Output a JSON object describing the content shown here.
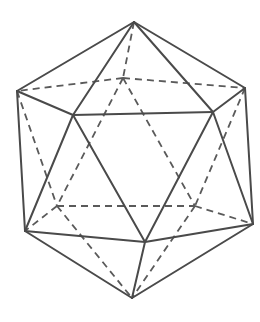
{
  "diagram": {
    "stroke_color": "#4a4a4a",
    "background": "#ffffff",
    "vertices": {
      "T": [
        134,
        22
      ],
      "L": [
        17,
        91
      ],
      "R": [
        245,
        88
      ],
      "BU": [
        123,
        78
      ],
      "FL": [
        73,
        115
      ],
      "FR": [
        213,
        112
      ],
      "LL": [
        25,
        231
      ],
      "LR": [
        253,
        224
      ],
      "BF": [
        145,
        242
      ],
      "HLL": [
        57,
        206
      ],
      "HLR": [
        195,
        206
      ],
      "B": [
        132,
        298
      ]
    },
    "solid_edges": [
      [
        "T",
        "L"
      ],
      [
        "T",
        "FL"
      ],
      [
        "T",
        "FR"
      ],
      [
        "T",
        "R"
      ],
      [
        "L",
        "FL"
      ],
      [
        "FL",
        "FR"
      ],
      [
        "FR",
        "R"
      ],
      [
        "L",
        "LL"
      ],
      [
        "FL",
        "LL"
      ],
      [
        "FL",
        "BF"
      ],
      [
        "FR",
        "BF"
      ],
      [
        "FR",
        "LR"
      ],
      [
        "R",
        "LR"
      ],
      [
        "LL",
        "BF"
      ],
      [
        "BF",
        "LR"
      ],
      [
        "LL",
        "B"
      ],
      [
        "BF",
        "B"
      ],
      [
        "LR",
        "B"
      ]
    ],
    "dashed_edges": [
      [
        "T",
        "BU"
      ],
      [
        "BU",
        "L"
      ],
      [
        "BU",
        "R"
      ],
      [
        "BU",
        "HLL"
      ],
      [
        "BU",
        "HLR"
      ],
      [
        "L",
        "HLL"
      ],
      [
        "R",
        "HLR"
      ],
      [
        "HLL",
        "HLR"
      ],
      [
        "HLL",
        "LL"
      ],
      [
        "HLR",
        "LR"
      ],
      [
        "HLL",
        "B"
      ],
      [
        "HLR",
        "B"
      ]
    ]
  }
}
